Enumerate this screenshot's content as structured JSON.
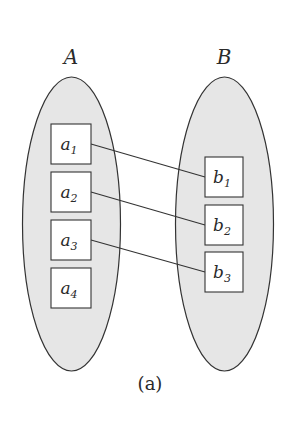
{
  "diagram": {
    "caption": "(a)",
    "colors": {
      "set_fill": "#e6e6e6",
      "stroke": "#333333",
      "box_fill": "#ffffff"
    },
    "sets": [
      {
        "name": "A",
        "elements": [
          {
            "base": "a",
            "sub": "1"
          },
          {
            "base": "a",
            "sub": "2"
          },
          {
            "base": "a",
            "sub": "3"
          },
          {
            "base": "a",
            "sub": "4"
          }
        ]
      },
      {
        "name": "B",
        "elements": [
          {
            "base": "b",
            "sub": "1"
          },
          {
            "base": "b",
            "sub": "2"
          },
          {
            "base": "b",
            "sub": "3"
          }
        ]
      }
    ],
    "mappings": [
      {
        "from": "a1",
        "to": "b1"
      },
      {
        "from": "a2",
        "to": "b2"
      },
      {
        "from": "a3",
        "to": "b3"
      }
    ]
  }
}
